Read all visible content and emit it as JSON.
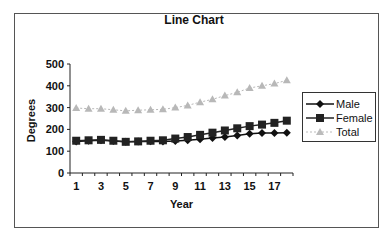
{
  "chart_data": {
    "type": "line",
    "title": "Line Chart",
    "xlabel": "Year",
    "ylabel": "Degrees",
    "ylim": [
      0,
      500
    ],
    "yticks": [
      0,
      100,
      200,
      300,
      400,
      500
    ],
    "x": [
      1,
      2,
      3,
      4,
      5,
      6,
      7,
      8,
      9,
      10,
      11,
      12,
      13,
      14,
      15,
      16,
      17,
      18
    ],
    "xtick_labels": [
      "1",
      "3",
      "5",
      "7",
      "9",
      "11",
      "13",
      "15",
      "17"
    ],
    "grid": false,
    "legend_position": "right",
    "series": [
      {
        "name": "Male",
        "marker": "diamond",
        "color": "#111111",
        "line": "solid",
        "values": [
          145,
          148,
          150,
          147,
          143,
          145,
          146,
          145,
          147,
          150,
          155,
          160,
          165,
          172,
          180,
          183,
          183,
          185
        ]
      },
      {
        "name": "Female",
        "marker": "square",
        "color": "#222222",
        "line": "solid",
        "values": [
          148,
          150,
          152,
          148,
          143,
          145,
          148,
          150,
          158,
          165,
          175,
          185,
          195,
          205,
          215,
          222,
          230,
          240
        ]
      },
      {
        "name": "Total",
        "marker": "triangle",
        "color": "#b8b8b8",
        "line": "dashed",
        "values": [
          298,
          295,
          295,
          290,
          285,
          288,
          290,
          292,
          300,
          310,
          325,
          338,
          355,
          370,
          390,
          400,
          410,
          425
        ]
      }
    ]
  },
  "legend": {
    "items": [
      {
        "label": "Male"
      },
      {
        "label": "Female"
      },
      {
        "label": "Total"
      }
    ]
  }
}
